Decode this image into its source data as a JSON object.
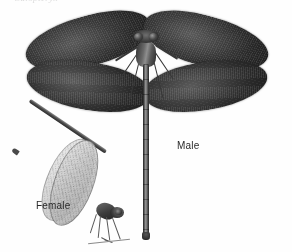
{
  "plate": {
    "width": 292,
    "height": 252,
    "background_color": "#fefefe",
    "rendering": "grayscale halftone photographic plate",
    "top_caption": "Calopteryx",
    "top_caption_note": "faint cursive text clipped by the top edge of the image, largely illegible"
  },
  "specimens": [
    {
      "id": "male",
      "label": "Male",
      "view": "dorsal",
      "wing_color": "#2b2b2b",
      "body_color": "#3a3a3a",
      "wing_count": 4,
      "description": "damselfly with four broad dark wings spread horizontally, prominent compound eyes and a long slender abdomen extending downward"
    },
    {
      "id": "female",
      "label": "Female",
      "view": "lateral",
      "wing_color": "#c4c4c4",
      "body_color": "#4c4c4c",
      "wing_count": 2,
      "description": "smaller damselfly in side view with pale translucent wings folded upward and a long abdomen angled to the upper left"
    }
  ],
  "labels": {
    "male": "Male",
    "female": "Female"
  },
  "colors": {
    "background": "#fefefe",
    "label_text": "#2a2a2a",
    "male_wing_dark": "#262626",
    "male_wing_light": "#5a5a5a",
    "female_wing": "#c8c8c8",
    "caption_faint": "#bdbdbd"
  }
}
